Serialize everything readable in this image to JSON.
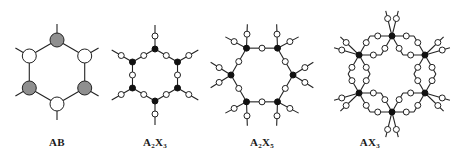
{
  "figure": {
    "panels": [
      {
        "id": "ab",
        "label": "AB",
        "label_parts": [
          {
            "t": "AB"
          }
        ],
        "label_x": 57,
        "structure": "hexagon-alternating",
        "center": [
          57,
          72
        ],
        "radius": 32,
        "orientation": "pointy-top",
        "a_node_color": "#8f8f8f",
        "x_node_color": "#ffffff",
        "node_radius": 7
      },
      {
        "id": "a2x3",
        "label": "A2X3",
        "label_parts": [
          {
            "t": "A"
          },
          {
            "s": "2"
          },
          {
            "t": "X"
          },
          {
            "s": "3"
          }
        ],
        "label_x": 155,
        "structure": "hexagon-bridged-one-terminal",
        "center": [
          155,
          75
        ],
        "radius": 26,
        "orientation": "pointy-top",
        "a_node_color": "#111111",
        "x_node_color": "#ffffff",
        "node_radius": 3
      },
      {
        "id": "a2x5",
        "label": "A2X5",
        "label_parts": [
          {
            "t": "A"
          },
          {
            "s": "2"
          },
          {
            "t": "X"
          },
          {
            "s": "5"
          }
        ],
        "label_x": 262,
        "structure": "hexagon-bridged-two-terminal",
        "center": [
          262,
          75
        ],
        "radius": 31,
        "orientation": "pointy-side",
        "a_node_color": "#111111",
        "x_node_color": "#ffffff",
        "node_radius": 3
      },
      {
        "id": "ax3",
        "label": "AX3",
        "label_parts": [
          {
            "t": "A"
          },
          {
            "t": "X"
          },
          {
            "s": "3"
          }
        ],
        "label_x": 370,
        "structure": "hexagon-double-bridged-terminal",
        "center": [
          392,
          74
        ],
        "radius": 38,
        "orientation": "pointy-top",
        "a_node_color": "#111111",
        "x_node_color": "#ffffff",
        "node_radius": 3
      }
    ]
  }
}
